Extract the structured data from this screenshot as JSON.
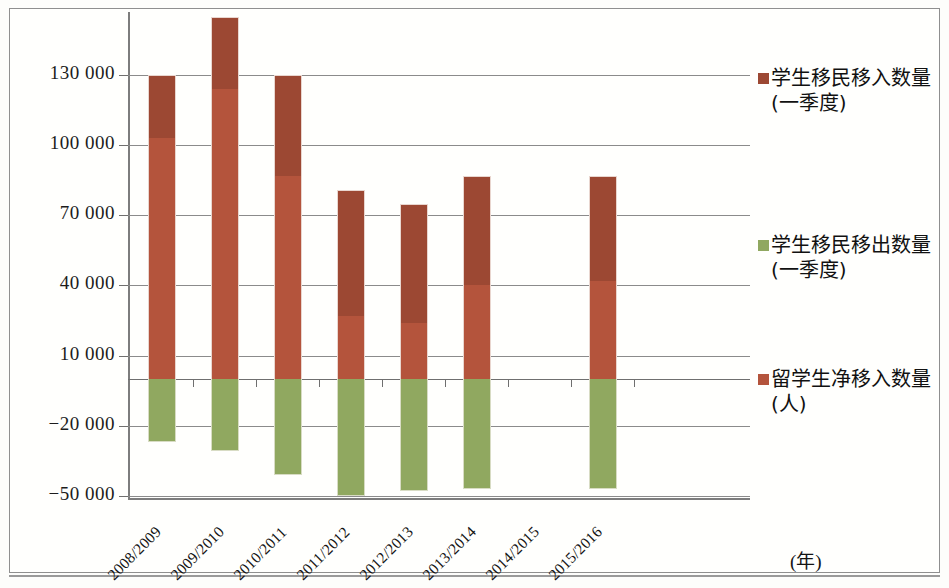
{
  "chart_data": {
    "type": "bar",
    "subtype": "stacked-with-negative",
    "title": "",
    "xlabel": "(年)",
    "ylabel": "",
    "categories": [
      "2008/2009",
      "2009/2010",
      "2010/2011",
      "2011/2012",
      "2012/2013",
      "2013/2014",
      "2014/2015",
      "2015/2016"
    ],
    "ytick_labels": [
      "130 000",
      "100 000",
      "70 000",
      "40 000",
      "10 000",
      "−20 000",
      "−50 000"
    ],
    "ytick_values": [
      130000,
      100000,
      70000,
      40000,
      10000,
      -20000,
      -50000
    ],
    "ylim": [
      -50000,
      160000
    ],
    "grid": true,
    "legend_position": "right",
    "series": [
      {
        "name": "学生移民移入数量(一季度)",
        "color": "#9c4833",
        "values": [
          130000,
          155000,
          130000,
          81000,
          75000,
          87000,
          null,
          87000
        ]
      },
      {
        "name": "学生移民移出数量(一季度)",
        "color": "#90a860",
        "values": [
          -27000,
          -31000,
          -41000,
          -50000,
          -48000,
          -47000,
          null,
          -47000
        ]
      },
      {
        "name": "留学生净移入数量(人)",
        "color": "#b4543c",
        "values": [
          103000,
          124000,
          87000,
          27000,
          24000,
          40000,
          null,
          42000
        ]
      }
    ]
  },
  "axis": {
    "y_ticks": [
      {
        "label": "130 000",
        "value": 130000
      },
      {
        "label": "100 000",
        "value": 100000
      },
      {
        "label": "70 000",
        "value": 70000
      },
      {
        "label": "40 000",
        "value": 40000
      },
      {
        "label": "10 000",
        "value": 10000
      },
      {
        "label": "−20 000",
        "value": -20000
      },
      {
        "label": "−50 000",
        "value": -50000
      }
    ],
    "x_labels": [
      "2008/2009",
      "2009/2010",
      "2010/2011",
      "2011/2012",
      "2012/2013",
      "2013/2014",
      "2014/2015",
      "2015/2016"
    ],
    "x_unit": "(年)"
  },
  "legend": {
    "items": [
      {
        "label_line1": "学生移民移入数量",
        "label_line2": "(一季度)",
        "color": "#9c4833"
      },
      {
        "label_line1": "学生移民移出数量",
        "label_line2": "(一季度)",
        "color": "#90a860"
      },
      {
        "label_line1": "留学生净移入数量",
        "label_line2": "(人)",
        "color": "#b4543c"
      }
    ]
  }
}
